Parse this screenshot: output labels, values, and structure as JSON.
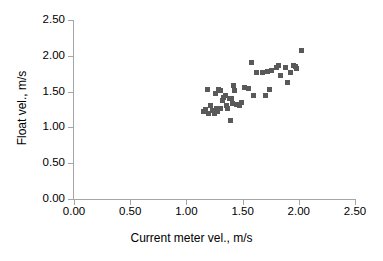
{
  "chart_data": {
    "type": "scatter",
    "title": "",
    "xlabel": "Current meter vel., m/s",
    "ylabel": "Float vel., m/s",
    "xlim": [
      0.0,
      2.5
    ],
    "ylim": [
      0.0,
      2.5
    ],
    "xticks": [
      "0.00",
      "0.50",
      "1.00",
      "1.50",
      "2.00",
      "2.50"
    ],
    "yticks": [
      "0.00",
      "0.50",
      "1.00",
      "1.50",
      "2.00",
      "2.50"
    ],
    "xtick_values": [
      0.0,
      0.5,
      1.0,
      1.5,
      2.0,
      2.5
    ],
    "ytick_values": [
      0.0,
      0.5,
      1.0,
      1.5,
      2.0,
      2.5
    ],
    "grid": false,
    "legend": false,
    "marker_color": "#595959",
    "marker_shape": "square",
    "axis_color": "#A6A6A6",
    "series": [
      {
        "name": "Float vs current meter velocity",
        "points": [
          [
            1.15,
            1.22
          ],
          [
            1.17,
            1.25
          ],
          [
            1.19,
            1.53
          ],
          [
            1.2,
            1.2
          ],
          [
            1.21,
            1.3
          ],
          [
            1.23,
            1.23
          ],
          [
            1.25,
            1.2
          ],
          [
            1.26,
            1.47
          ],
          [
            1.27,
            1.27
          ],
          [
            1.28,
            1.22
          ],
          [
            1.29,
            1.53
          ],
          [
            1.3,
            1.52
          ],
          [
            1.3,
            1.26
          ],
          [
            1.32,
            1.37
          ],
          [
            1.33,
            1.42
          ],
          [
            1.35,
            1.44
          ],
          [
            1.36,
            1.3
          ],
          [
            1.37,
            1.26
          ],
          [
            1.38,
            1.41
          ],
          [
            1.39,
            1.09
          ],
          [
            1.4,
            1.4
          ],
          [
            1.41,
            1.34
          ],
          [
            1.42,
            1.58
          ],
          [
            1.43,
            1.51
          ],
          [
            1.45,
            1.32
          ],
          [
            1.47,
            1.3
          ],
          [
            1.49,
            1.35
          ],
          [
            1.52,
            1.56
          ],
          [
            1.55,
            1.55
          ],
          [
            1.58,
            1.9
          ],
          [
            1.6,
            1.45
          ],
          [
            1.62,
            1.76
          ],
          [
            1.68,
            1.76
          ],
          [
            1.7,
            1.44
          ],
          [
            1.72,
            1.78
          ],
          [
            1.74,
            1.53
          ],
          [
            1.76,
            1.79
          ],
          [
            1.8,
            1.84
          ],
          [
            1.82,
            1.87
          ],
          [
            1.84,
            1.72
          ],
          [
            1.88,
            1.83
          ],
          [
            1.9,
            1.63
          ],
          [
            1.93,
            1.77
          ],
          [
            1.95,
            1.87
          ],
          [
            1.97,
            1.85
          ],
          [
            1.98,
            1.82
          ],
          [
            2.02,
            2.07
          ]
        ]
      }
    ]
  }
}
